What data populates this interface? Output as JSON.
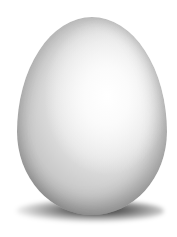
{
  "image": {
    "subject": "white egg",
    "background_color": "#ffffff",
    "egg_color": "#e8e8e8",
    "shadow_color": "#202020"
  }
}
